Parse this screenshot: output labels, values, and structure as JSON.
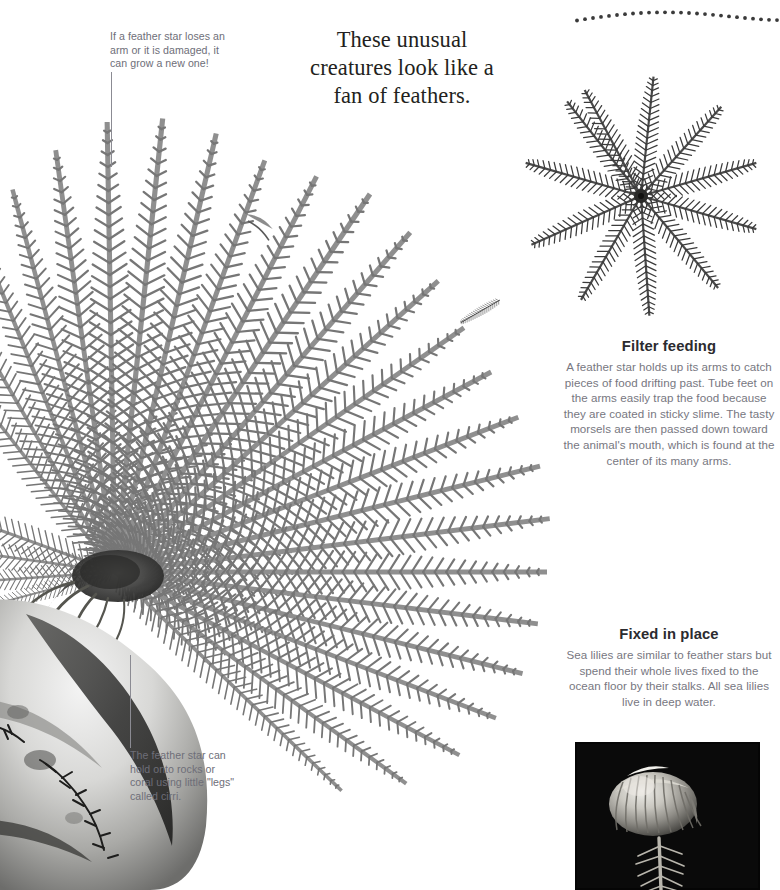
{
  "page": {
    "background_color": "#ffffff",
    "width": 775,
    "height": 890
  },
  "headline": {
    "text": "These unusual creatures look like a fan of feathers.",
    "color": "#231f20"
  },
  "callouts": [
    {
      "name": "regeneration-callout",
      "text": "If a feather star loses an arm or it is damaged, it can grow a new one!",
      "color": "#6e6e78"
    },
    {
      "name": "cirri-callout",
      "text": "The feather star can hold onto rocks or coral using little \"legs\" called cirri.",
      "color": "#6e6e78"
    }
  ],
  "sections": [
    {
      "name": "filter-feeding",
      "heading": "Filter feeding",
      "body": "A feather star holds up its arms to catch pieces of food drifting past. Tube feet on the arms easily trap the food because they are coated in sticky slime. The tasty morsels are then passed down toward the animal's mouth, which is found at the center of its many arms.",
      "heading_color": "#2b2b2f",
      "body_color": "#77777f"
    },
    {
      "name": "fixed-in-place",
      "heading": "Fixed in place",
      "body": "Sea lilies are similar to feather stars but spend their whole lives fixed to the ocean floor by their stalks. All sea lilies live in deep water.",
      "heading_color": "#2b2b2f",
      "body_color": "#77777f"
    }
  ],
  "images": [
    {
      "name": "large-feather-star-illustration",
      "caption_alt": "Large grayscale feather star with many feathery arms fanning out from a base anchored on a rock"
    },
    {
      "name": "feather-star-top-view-illustration",
      "caption_alt": "Feather star seen from above, ten feathery arms radiating from a central mouth"
    },
    {
      "name": "sea-lily-photograph",
      "caption_alt": "Photograph of a sea lily on a stalk against a black background",
      "background_color": "#050505"
    }
  ],
  "decoration": {
    "name": "dotted-arc",
    "dot_color": "#3a3a3a",
    "dot_count": 26
  }
}
